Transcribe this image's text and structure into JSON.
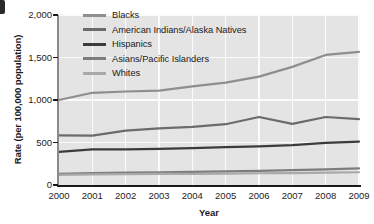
{
  "chart_data": {
    "type": "line",
    "title": "",
    "xlabel": "Year",
    "ylabel": "Rate (per 100,000 population)",
    "categories": [
      "2000",
      "2001",
      "2002",
      "2003",
      "2004",
      "2005",
      "2006",
      "2007",
      "2008",
      "2009"
    ],
    "x": [
      2000,
      2001,
      2002,
      2003,
      2004,
      2005,
      2006,
      2007,
      2008,
      2009
    ],
    "xlim": [
      2000,
      2009
    ],
    "ylim": [
      0,
      2000
    ],
    "yticks": [
      0,
      500,
      1000,
      1500,
      2000
    ],
    "ytick_labels": [
      "0",
      "500",
      "1,000",
      "1,500",
      "2,000"
    ],
    "grid": true,
    "legend_position": "top-center",
    "series": [
      {
        "name": "Blacks",
        "color": "#8e8e8e",
        "values": [
          1000,
          1085,
          1100,
          1110,
          1160,
          1205,
          1275,
          1390,
          1530,
          1565
        ]
      },
      {
        "name": "American Indians/Alaska Natives",
        "color": "#6b6b6b",
        "values": [
          585,
          580,
          640,
          665,
          685,
          715,
          800,
          720,
          800,
          775
        ]
      },
      {
        "name": "Hispanics",
        "color": "#3b3b3b",
        "values": [
          390,
          420,
          420,
          425,
          435,
          445,
          455,
          470,
          495,
          510
        ]
      },
      {
        "name": "Asians/Pacific Islanders",
        "color": "#7d7d7d",
        "values": [
          130,
          140,
          145,
          150,
          155,
          160,
          165,
          175,
          185,
          195
        ]
      },
      {
        "name": "Whites",
        "color": "#a9a9a9",
        "values": [
          120,
          125,
          128,
          130,
          132,
          135,
          138,
          140,
          145,
          150
        ]
      }
    ]
  },
  "axes": {
    "x_title": "Year",
    "y_title": "Rate (per 100,000 population)"
  },
  "colors": {
    "plot_background": "#e4e4e4",
    "gridline": "#fbfbfb",
    "axis": "#1b1b1b",
    "text": "#1a1a1a"
  }
}
